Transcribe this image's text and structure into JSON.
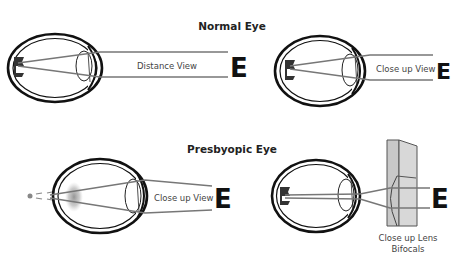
{
  "diagram": {
    "sections": [
      {
        "title": "Normal Eye",
        "panels": [
          {
            "label": "Distance View",
            "target": "E"
          },
          {
            "label": "Close up View",
            "target": "E"
          }
        ]
      },
      {
        "title": "Presbyopic Eye",
        "panels": [
          {
            "label": "Close up View",
            "target": "E"
          },
          {
            "label_line1": "Close up Lens",
            "label_line2": "Bifocals",
            "target": "E"
          }
        ]
      }
    ],
    "colors": {
      "outline": "#111111",
      "ray": "#777777",
      "blur": "#999999",
      "bifocal_fill": "#cccccc"
    }
  }
}
